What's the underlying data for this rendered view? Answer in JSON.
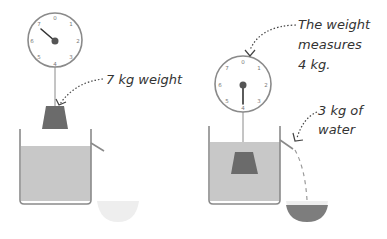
{
  "diagram": {
    "topic": "Buoyancy demonstration",
    "left_panel": {
      "annotation": "7 kg weight",
      "scale_reading_kg": 7,
      "dial_numbers": [
        "0",
        "1",
        "2",
        "3",
        "4",
        "5",
        "6",
        "7"
      ]
    },
    "right_panel": {
      "annotation_line1": "The weight",
      "annotation_line2": "measures",
      "annotation_line3": "4 kg.",
      "water_annotation_line1": "3 kg of",
      "water_annotation_line2": "water",
      "scale_reading_kg": 4,
      "dial_numbers": [
        "0",
        "1",
        "2",
        "3",
        "4",
        "5",
        "6",
        "7"
      ]
    },
    "colors": {
      "outline": "#8a8a8a",
      "water": "#c8c8c8",
      "weight": "#6b6b6b",
      "needle": "#333333",
      "text": "#333333",
      "bowl": "#eeeeee"
    }
  }
}
